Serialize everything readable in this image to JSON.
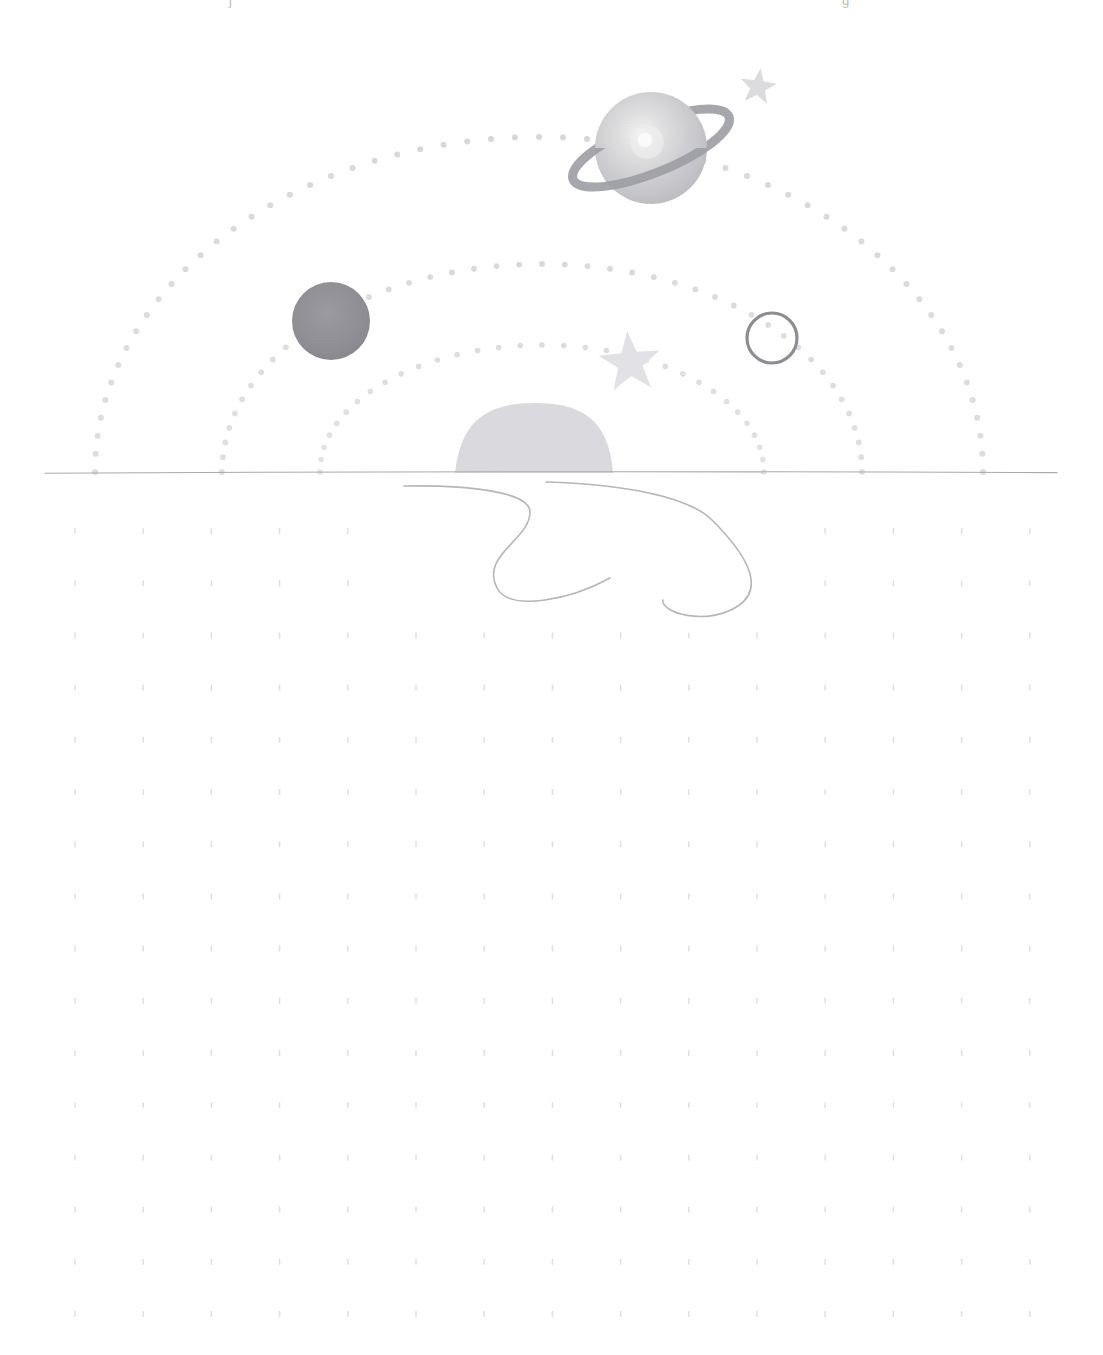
{
  "page": {
    "background_color": "#ffffff",
    "width": 1103,
    "height": 1355
  },
  "top_edge_marks": [
    {
      "name": "left-clipped-glyph",
      "text": "j",
      "x": 229
    },
    {
      "name": "right-clipped-glyph",
      "text": "g",
      "x": 842
    }
  ],
  "sky": {
    "horizon_line": {
      "label": "horizon",
      "color": "#a9a9ae",
      "y": 472,
      "x_start": 45,
      "x_end": 1057,
      "thickness": 1.1
    },
    "orbits": [
      {
        "name": "outer-orbit",
        "label": "Outer orbit",
        "center_x": 539,
        "radius_x": 444,
        "radius_y": 335,
        "dot_color": "#d7d7db",
        "dot_radius": 3.0,
        "dot_count": 58,
        "left_end_x": 95,
        "right_end_x": 983
      },
      {
        "name": "middle-orbit",
        "label": "Middle orbit",
        "center_x": 542,
        "radius_x": 320,
        "radius_y": 208,
        "dot_color": "#d9d9dd",
        "dot_radius": 2.9,
        "dot_count": 44,
        "left_end_x": 222,
        "right_end_x": 862
      },
      {
        "name": "inner-orbit",
        "label": "Inner orbit",
        "center_x": 542,
        "radius_x": 222,
        "radius_y": 127,
        "dot_color": "#dcdce0",
        "dot_radius": 2.8,
        "dot_count": 32,
        "left_end_x": 320,
        "right_end_x": 765
      }
    ],
    "bodies": [
      {
        "name": "ringed-planet",
        "label": "Ringed planet",
        "cx": 651,
        "cy": 148,
        "r": 56,
        "body_color": "#c3c3c8",
        "highlight_color": "#eeeef0",
        "ring_color": "#9c9ca4",
        "ring_width": 9,
        "ring_rx": 84,
        "ring_ry": 25,
        "ring_rotation": -22
      },
      {
        "name": "dark-planet",
        "label": "Dark planet",
        "cx": 331,
        "cy": 321,
        "r": 39,
        "body_color": "#8e8e94"
      },
      {
        "name": "ring-outline-planet",
        "label": "Outlined planet",
        "cx": 772,
        "cy": 338,
        "r": 25,
        "stroke_color": "#8d8d93",
        "stroke_width": 3.2
      },
      {
        "name": "small-star",
        "label": "Small star",
        "cx": 758,
        "cy": 87,
        "outer_r": 19,
        "inner_r": 8,
        "color": "#dcdce0",
        "rotation": 8
      },
      {
        "name": "large-star",
        "label": "Large star",
        "cx": 630,
        "cy": 363,
        "outer_r": 32,
        "inner_r": 13,
        "color": "#e2e2e6",
        "rotation": -5
      }
    ]
  },
  "ground": {
    "hill": {
      "name": "hill",
      "label": "Hill",
      "fill": "#dadade",
      "peak_x": 535,
      "peak_y": 403,
      "left_x": 455,
      "right_x": 613,
      "base_y": 473
    },
    "river": {
      "name": "river",
      "label": "Winding river",
      "stroke": "#b6b6bb",
      "stroke_width": 1.6,
      "left_bank": "M 404 486 C 470 485 530 492 530 512 C 530 540 480 555 497 588 C 510 612 570 600 610 578",
      "right_bank": "M 546 482 C 620 484 688 496 712 520 C 742 550 768 586 738 606 C 706 627 660 612 663 600"
    },
    "grid": {
      "name": "dot-grid",
      "label": "Dot grid",
      "dot_color": "#dededf",
      "dot_width": 1.4,
      "dot_height": 6,
      "start_x": 75,
      "step_x": 68.2,
      "columns": 15,
      "start_y": 531,
      "step_y": 52.2,
      "rows": 16,
      "masked_region": {
        "note": "river area clears grid dots in the first two rows",
        "x_min": 390,
        "x_max": 790,
        "row_max": 1
      }
    }
  }
}
